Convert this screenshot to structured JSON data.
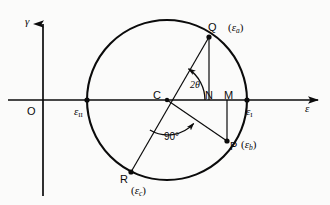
{
  "figure": {
    "background_color": "#fbfbfa",
    "line_color": "#0b0b0b"
  },
  "axes": {
    "x_axis_label": "ε",
    "y_axis_label": "γ",
    "origin_label": "O"
  },
  "points": {
    "center": "C",
    "foot_n": "N",
    "foot_m": "M",
    "q": "Q",
    "p": "P",
    "r": "R"
  },
  "value_labels": {
    "eps_one": "ε",
    "eps_one_sub": "I",
    "eps_two": "ε",
    "eps_two_sub": "II",
    "q_value_open": "(",
    "q_value_eps": "ε",
    "q_value_sub": "a",
    "q_value_close": ")",
    "p_value_open": "(",
    "p_value_eps": "ε",
    "p_value_sub": "b",
    "p_value_close": ")",
    "r_value_open": "(",
    "r_value_eps": "ε",
    "r_value_sub": "c",
    "r_value_close": ")"
  },
  "angles": {
    "theta_label": "2θ",
    "right_angle_label": "90°"
  },
  "geometry": {
    "circle_center_x": 167,
    "circle_center_y": 100,
    "circle_radius": 80,
    "x_axis_y": 100,
    "y_axis_x": 43,
    "point_q_x": 209,
    "point_q_y": 37,
    "point_p_x": 227,
    "point_p_y": 141,
    "point_r_x": 131,
    "point_r_y": 172,
    "point_n_x": 209,
    "point_m_x": 227
  }
}
